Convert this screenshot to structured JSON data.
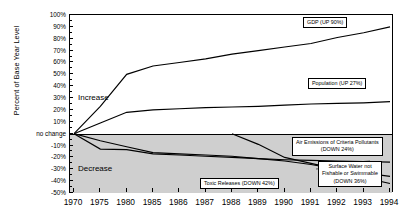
{
  "chart_data": {
    "type": "line",
    "title": "",
    "xlabel": "",
    "ylabel": "Percent of Base Year Level",
    "x": [
      1970,
      1975,
      1980,
      1985,
      1986,
      1987,
      1988,
      1989,
      1990,
      1991,
      1992,
      1993,
      1994
    ],
    "xtick_labels": [
      "1970",
      "1975",
      "1980",
      "1985",
      "1986",
      "1987",
      "1988",
      "1989",
      "1990",
      "1991",
      "1992",
      "1993",
      "1994"
    ],
    "ylim": [
      -50,
      100
    ],
    "ytick_labels": [
      "100%",
      "90%",
      "80%",
      "70%",
      "60%",
      "50%",
      "40%",
      "30%",
      "20%",
      "10%",
      "no change",
      "-10%",
      "-20%",
      "-30%",
      "-40%",
      "-50%"
    ],
    "ytick_values": [
      100,
      90,
      80,
      70,
      60,
      50,
      40,
      30,
      20,
      10,
      0,
      -10,
      -20,
      -30,
      -40,
      -50
    ],
    "grid": false,
    "legend_position": "inline-callouts",
    "zone_labels": [
      {
        "text": "Increase",
        "value": 30
      },
      {
        "text": "Decrease",
        "value": -30
      }
    ],
    "series": [
      {
        "name": "GDP",
        "label": "GDP (UP 90%)",
        "change_percent": 90,
        "direction": "up",
        "x": [
          1970,
          1975,
          1980,
          1985,
          1986,
          1987,
          1988,
          1989,
          1990,
          1991,
          1992,
          1993,
          1994
        ],
        "values": [
          0,
          23,
          50,
          57,
          60,
          63,
          67,
          70,
          73,
          76,
          81,
          85,
          90
        ]
      },
      {
        "name": "Population",
        "label": "Population (UP 27%)",
        "change_percent": 27,
        "direction": "up",
        "x": [
          1970,
          1975,
          1980,
          1985,
          1986,
          1987,
          1988,
          1989,
          1990,
          1991,
          1992,
          1993,
          1994
        ],
        "values": [
          0,
          9,
          18,
          20,
          21,
          22,
          22.5,
          23,
          24,
          25,
          25.5,
          26,
          27
        ]
      },
      {
        "name": "Air Emissions of Criteria Pollutants",
        "label": "Air Emissions of Criteria Pollutants (DOWN 24%)",
        "change_percent": -24,
        "direction": "down",
        "x": [
          1970,
          1975,
          1980,
          1985,
          1986,
          1987,
          1988,
          1989,
          1990,
          1991,
          1992,
          1993,
          1994
        ],
        "values": [
          0,
          -13,
          -13.5,
          -17,
          -18,
          -19,
          -20,
          -21,
          -22,
          -22.5,
          -23,
          -23.5,
          -24
        ]
      },
      {
        "name": "Surface Water not Fishable or Swimmable",
        "label": "Surface Water not Fishable or Swimmable (DOWN 36%)",
        "change_percent": -36,
        "direction": "down",
        "x": [
          1970,
          1975,
          1980,
          1985,
          1986,
          1987,
          1988,
          1989,
          1990,
          1991,
          1992,
          1993,
          1994
        ],
        "values": [
          0,
          -6,
          -11,
          -16,
          -17,
          -18,
          -19,
          -21,
          -23,
          -26,
          -30,
          -33,
          -36
        ]
      },
      {
        "name": "Toxic Releases",
        "label": "Toxic Releases (DOWN 42%)",
        "change_percent": -42,
        "direction": "down",
        "x": [
          1988,
          1989,
          1990,
          1991,
          1992,
          1993,
          1994
        ],
        "values": [
          0,
          -9,
          -20,
          -25,
          -30,
          -37,
          -42
        ]
      }
    ]
  },
  "callouts": {
    "gdp": "GDP (UP 90%)",
    "population": "Population (UP 27%)",
    "air_line1": "Air Emissions of Criteria Pollutants",
    "air_line2": "(DOWN 24%)",
    "water_line1": "Surface Water not",
    "water_line2": "Fishable or Swimmable",
    "water_line3": "(DOWN 36%)",
    "toxic": "Toxic Releases (DOWN 42%)"
  },
  "axis": {
    "y_title": "Percent of Base Year Level"
  }
}
